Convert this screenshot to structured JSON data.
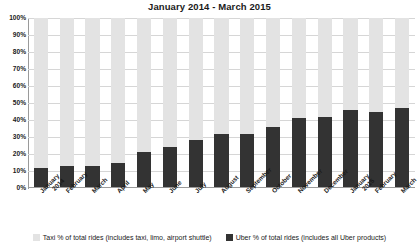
{
  "chart_data": {
    "type": "bar",
    "stacked": true,
    "title": "January 2014 - March 2015",
    "xlabel": "",
    "ylabel": "",
    "ylim": [
      0,
      100
    ],
    "ytick_labels": [
      "100%",
      "90%",
      "80%",
      "70%",
      "60%",
      "50%",
      "40%",
      "30%",
      "20%",
      "10%",
      "0%"
    ],
    "ytick_values": [
      100,
      90,
      80,
      70,
      60,
      50,
      40,
      30,
      20,
      10,
      0
    ],
    "grid": true,
    "legend_position": "bottom",
    "categories": [
      "January\n2014",
      "February",
      "March",
      "April",
      "May",
      "June",
      "July",
      "August",
      "September",
      "October",
      "November",
      "December",
      "January\n2015",
      "February",
      "March"
    ],
    "series": [
      {
        "name": "Uber % of total rides (includes all Uber products)",
        "color": "#333333",
        "values": [
          12,
          13,
          13,
          15,
          21,
          24,
          28,
          32,
          32,
          36,
          41,
          42,
          46,
          45,
          47
        ]
      },
      {
        "name": "Taxi % of total rides (includes taxi, limo, airport shuttle)",
        "color": "#e3e3e3",
        "values": [
          88,
          87,
          87,
          85,
          79,
          76,
          72,
          68,
          68,
          64,
          59,
          58,
          54,
          55,
          53
        ]
      }
    ]
  },
  "legend": {
    "items": [
      {
        "label": "Taxi % of total rides (includes taxi, limo, airport shuttle)",
        "swatch": "taxi"
      },
      {
        "label": "Uber % of total rides (includes all Uber products)",
        "swatch": "uber"
      }
    ]
  }
}
